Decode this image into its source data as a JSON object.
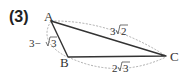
{
  "problem_number": "(3)",
  "vertices": {
    "A": {
      "label": "A"
    },
    "B": {
      "label": "B"
    },
    "C": {
      "label": "C"
    }
  },
  "edges": {
    "AB": {
      "label_prefix": "3−",
      "label_radicand": "3"
    },
    "AC": {
      "label_coef": "3",
      "label_radicand": "2"
    },
    "BC": {
      "label_coef": "2",
      "label_radicand": "3"
    }
  },
  "colors": {
    "triangle": "#333333",
    "dashed": "#999999",
    "text": "#333333"
  }
}
